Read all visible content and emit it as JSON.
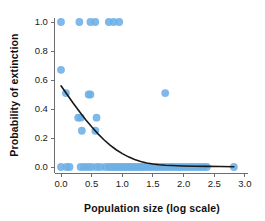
{
  "chart_data": {
    "type": "scatter",
    "title": "",
    "subtitle": "",
    "xlabel": "Population size (log scale)",
    "ylabel": "Probability of extinction",
    "xlim": [
      -0.1,
      3.05
    ],
    "ylim": [
      -0.06,
      1.08
    ],
    "xticks": [
      "0.0",
      "0.5",
      "1.0",
      "1.5",
      "2.0",
      "2.5",
      "3.0"
    ],
    "xtick_values": [
      0.0,
      0.5,
      1.0,
      1.5,
      2.0,
      2.5,
      3.0
    ],
    "yticks": [
      "0.0",
      "0.2",
      "0.4",
      "0.6",
      "0.8",
      "1.0"
    ],
    "ytick_values": [
      0.0,
      0.2,
      0.4,
      0.6,
      0.8,
      1.0
    ],
    "grid": false,
    "legend": false,
    "legend_position": "none",
    "marker_color": "#6cafe6",
    "curve_color": "#16181a",
    "axis_color": "#6e6e6e",
    "series": [
      {
        "name": "Observed populations",
        "marker": "circle",
        "color": "#6cafe6",
        "points": [
          [
            0.0,
            1.0
          ],
          [
            0.3,
            1.0
          ],
          [
            0.48,
            1.0
          ],
          [
            0.56,
            1.0
          ],
          [
            0.78,
            1.0
          ],
          [
            0.86,
            1.0
          ],
          [
            0.95,
            1.0
          ],
          [
            0.0,
            0.67
          ],
          [
            0.08,
            0.51
          ],
          [
            0.45,
            0.5
          ],
          [
            0.48,
            0.5
          ],
          [
            1.7,
            0.51
          ],
          [
            0.28,
            0.34
          ],
          [
            0.32,
            0.34
          ],
          [
            0.58,
            0.34
          ],
          [
            0.34,
            0.25
          ],
          [
            0.56,
            0.25
          ],
          [
            0.0,
            0.0
          ],
          [
            0.09,
            0.0
          ],
          [
            0.14,
            0.0
          ],
          [
            0.32,
            0.0
          ],
          [
            0.38,
            0.0
          ],
          [
            0.44,
            0.0
          ],
          [
            0.5,
            0.0
          ],
          [
            0.58,
            0.0
          ],
          [
            0.64,
            0.0
          ],
          [
            0.72,
            0.0
          ],
          [
            0.78,
            0.0
          ],
          [
            0.82,
            0.0
          ],
          [
            0.86,
            0.0
          ],
          [
            0.9,
            0.0
          ],
          [
            0.94,
            0.0
          ],
          [
            0.98,
            0.0
          ],
          [
            1.02,
            0.0
          ],
          [
            1.06,
            0.0
          ],
          [
            1.1,
            0.0
          ],
          [
            1.14,
            0.0
          ],
          [
            1.18,
            0.0
          ],
          [
            1.22,
            0.0
          ],
          [
            1.26,
            0.0
          ],
          [
            1.3,
            0.0
          ],
          [
            1.34,
            0.0
          ],
          [
            1.38,
            0.0
          ],
          [
            1.43,
            0.0
          ],
          [
            1.48,
            0.0
          ],
          [
            1.53,
            0.0
          ],
          [
            1.58,
            0.0
          ],
          [
            1.63,
            0.0
          ],
          [
            1.68,
            0.0
          ],
          [
            1.73,
            0.0
          ],
          [
            1.78,
            0.0
          ],
          [
            1.83,
            0.0
          ],
          [
            1.88,
            0.0
          ],
          [
            1.93,
            0.0
          ],
          [
            1.98,
            0.0
          ],
          [
            2.03,
            0.0
          ],
          [
            2.08,
            0.0
          ],
          [
            2.13,
            0.0
          ],
          [
            2.18,
            0.0
          ],
          [
            2.23,
            0.0
          ],
          [
            2.28,
            0.0
          ],
          [
            2.33,
            0.0
          ],
          [
            2.38,
            0.0
          ],
          [
            2.82,
            0.0
          ]
        ]
      }
    ],
    "fit_curve": {
      "name": "Logistic fit",
      "color": "#16181a",
      "points": [
        [
          0.0,
          0.56
        ],
        [
          0.1,
          0.5
        ],
        [
          0.2,
          0.44
        ],
        [
          0.3,
          0.383
        ],
        [
          0.4,
          0.328
        ],
        [
          0.5,
          0.277
        ],
        [
          0.6,
          0.23
        ],
        [
          0.7,
          0.188
        ],
        [
          0.8,
          0.151
        ],
        [
          0.9,
          0.119
        ],
        [
          1.0,
          0.092
        ],
        [
          1.1,
          0.07
        ],
        [
          1.2,
          0.052
        ],
        [
          1.3,
          0.038
        ],
        [
          1.4,
          0.028
        ],
        [
          1.5,
          0.021
        ],
        [
          1.6,
          0.016
        ],
        [
          1.7,
          0.012
        ],
        [
          1.8,
          0.01
        ],
        [
          2.0,
          0.007
        ],
        [
          2.2,
          0.005
        ],
        [
          2.4,
          0.004
        ],
        [
          2.6,
          0.003
        ],
        [
          2.82,
          0.002
        ]
      ]
    }
  }
}
